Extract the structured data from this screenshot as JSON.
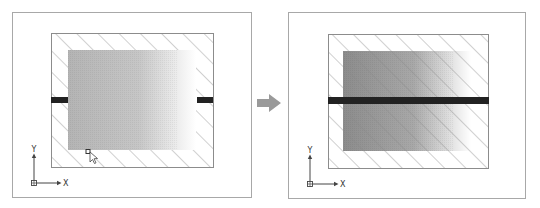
{
  "diagram": {
    "type": "before-after CAD hatch illustration",
    "colors": {
      "panel_border": "#a8a8a8",
      "hatch_line": "#8a8a8a",
      "boundary": "#8c8c8c",
      "bar": "#222222",
      "arrow": "#9a9a9a",
      "before_gradient_start": "#b4b4b4",
      "after_gradient_start": "#8c8c8c",
      "gradient_end": "#ffffff"
    },
    "panels": [
      {
        "id": "before",
        "hatch_region": "outer frame only (hatch visible in border band around gradient fill)",
        "bar": "split — short stubs at left and right edges",
        "cursor": "grip with pointer near bottom-left of gradient",
        "ucs": {
          "x_label": "X",
          "y_label": "Y"
        }
      },
      {
        "id": "after",
        "hatch_region": "entire rectangle including over gradient fill",
        "bar": "continuous across full width",
        "ucs": {
          "x_label": "X",
          "y_label": "Y"
        }
      }
    ],
    "transition_arrow": "right"
  }
}
